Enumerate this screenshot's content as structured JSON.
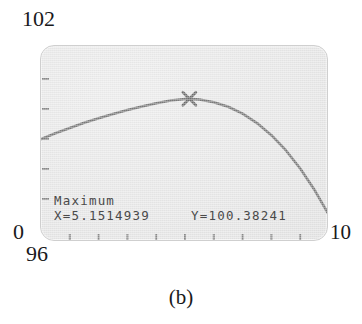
{
  "figure": {
    "caption": "(b)",
    "device": "graphing-calculator-screen"
  },
  "axis_labels": {
    "y_max": "102",
    "y_min": "96",
    "x_min": "0",
    "x_max": "10"
  },
  "readout": {
    "title": "Maximum",
    "x_value": "X=5.1514939",
    "y_value": "Y=100.38241"
  },
  "colors": {
    "screen_background": "#e6e6e6",
    "screen_border": "#cfcfcf",
    "curve": "#7a7a7a",
    "tick": "#8a8a8a",
    "text": "#4a4a4a",
    "label_text": "#19191b"
  },
  "chart_data": {
    "type": "line",
    "title": "Maximum",
    "xlabel": "",
    "ylabel": "",
    "xlim": [
      0,
      10
    ],
    "ylim": [
      96,
      102
    ],
    "grid": false,
    "legend": "none",
    "x_ticks": [
      1,
      2,
      3,
      4,
      5,
      6,
      7,
      8,
      9
    ],
    "y_ticks": [
      97,
      98,
      99,
      100,
      101
    ],
    "annotations": [
      {
        "label": "Maximum",
        "marker": "x-cross",
        "x": 5.1514939,
        "y": 100.38241
      }
    ],
    "series": [
      {
        "name": "curve",
        "x": [
          0.0,
          0.5,
          1.0,
          1.5,
          2.0,
          2.5,
          3.0,
          3.5,
          4.0,
          4.5,
          5.0,
          5.1514939,
          5.5,
          6.0,
          6.5,
          7.0,
          7.5,
          8.0,
          8.5,
          9.0,
          9.5,
          10.0
        ],
        "y": [
          99.15,
          99.33,
          99.49,
          99.65,
          99.79,
          99.92,
          100.04,
          100.15,
          100.25,
          100.33,
          100.38,
          100.38241,
          100.36,
          100.28,
          100.14,
          99.93,
          99.64,
          99.27,
          98.81,
          98.25,
          97.59,
          96.82
        ]
      }
    ]
  }
}
